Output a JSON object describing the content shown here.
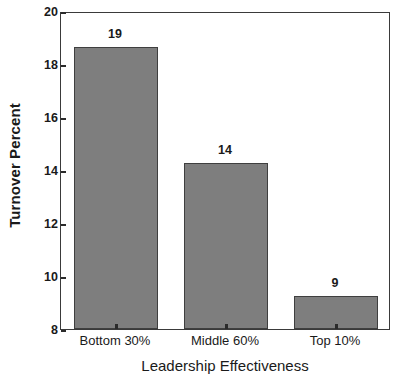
{
  "chart_data": {
    "type": "bar",
    "title": "",
    "subtitle": "",
    "xlabel": "Leadership Effectiveness",
    "ylabel": "Turnover Percent",
    "categories": [
      "Bottom 30%",
      "Middle 60%",
      "Top 10%"
    ],
    "values": [
      18.65,
      14.25,
      9.25
    ],
    "data_labels": [
      "19",
      "14",
      "9"
    ],
    "ylim": [
      8,
      20
    ],
    "yticks": [
      8,
      10,
      12,
      14,
      16,
      18,
      20
    ],
    "ytick_labels": [
      "8",
      "10",
      "12",
      "14",
      "16",
      "18",
      "20"
    ],
    "grid": false,
    "legend": false,
    "legend_position": "none",
    "bar_color": "#7e7e7e",
    "bar_edge_color": "#3f3f3f",
    "axis_color": "#3a3a3a",
    "text_color": "#1a1a1a",
    "background_color": "#ffffff",
    "frame": "full-box",
    "bars": [
      {
        "category": "Bottom 30%",
        "value": 18.65,
        "label": "19"
      },
      {
        "category": "Middle 60%",
        "value": 14.25,
        "label": "14"
      },
      {
        "category": "Top 10%",
        "value": 9.25,
        "label": "9"
      }
    ]
  }
}
